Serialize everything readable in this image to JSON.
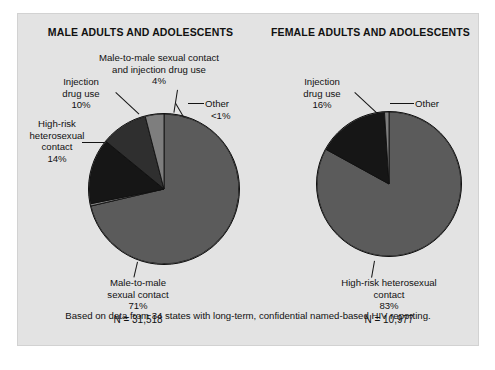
{
  "figure": {
    "background_color": "#e3e3e3",
    "footnote": "Based on data from 34 states with long-term, confidential named-based HIV reporting."
  },
  "panels": [
    {
      "id": "male",
      "title": "MALE ADULTS AND ADOLESCENTS",
      "n_label": "N = 31,518",
      "labels": {
        "mm_sexual_idu_line1": "Male-to-male sexual contact",
        "mm_sexual_idu_line2": "and injection drug use",
        "mm_sexual_idu_pct": "4%",
        "injection_line1": "Injection",
        "injection_line2": "drug use",
        "injection_pct": "10%",
        "other_name": "Other",
        "other_pct": "<1%",
        "highrisk_line1": "High-risk",
        "highrisk_line2": "heterosexual",
        "highrisk_line3": "contact",
        "highrisk_pct": "14%",
        "mm_sexual_line1": "Male-to-male",
        "mm_sexual_line2": "sexual contact",
        "mm_sexual_pct": "71%"
      }
    },
    {
      "id": "female",
      "title": "FEMALE ADULTS AND ADOLESCENTS",
      "n_label": "N = 10,977",
      "labels": {
        "injection_line1": "Injection",
        "injection_line2": "drug use",
        "injection_pct": "16%",
        "other_name": "Other",
        "highrisk_line1": "High-risk heterosexual",
        "highrisk_line2": "contact",
        "highrisk_pct": "83%"
      }
    }
  ],
  "chart_data": [
    {
      "type": "pie",
      "title": "MALE ADULTS AND ADOLESCENTS",
      "total_n": 31518,
      "total_n_text": "N = 31,518",
      "legend": "none",
      "labels": [
        "Male-to-male sexual contact",
        "Other",
        "High-risk heterosexual contact",
        "Injection drug use",
        "Male-to-male sexual contact and injection drug use"
      ],
      "values": [
        71,
        0.5,
        14,
        10,
        4
      ],
      "value_labels": [
        "71%",
        "<1%",
        "14%",
        "10%",
        "4%"
      ],
      "colors": [
        "#5b5b5b",
        "#7e7e7e",
        "#161616",
        "#2f2f2f",
        "#7e7e7e"
      ],
      "start_angle_deg": 0,
      "direction": "clockwise"
    },
    {
      "type": "pie",
      "title": "FEMALE ADULTS AND ADOLESCENTS",
      "total_n": 10977,
      "total_n_text": "N = 10,977",
      "legend": "none",
      "labels": [
        "High-risk heterosexual contact",
        "Injection drug use",
        "Other"
      ],
      "values": [
        83,
        16,
        1
      ],
      "value_labels": [
        "83%",
        "16%",
        ""
      ],
      "colors": [
        "#5b5b5b",
        "#161616",
        "#7e7e7e"
      ],
      "start_angle_deg": 0,
      "direction": "clockwise"
    }
  ]
}
